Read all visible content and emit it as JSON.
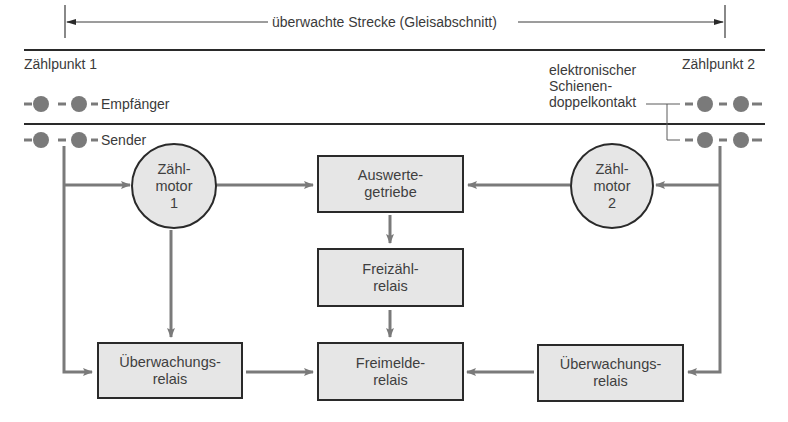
{
  "header": {
    "section_label": "überwachte Strecke (Gleisabschnitt)"
  },
  "counting_points": [
    {
      "label": "Zählpunkt 1"
    },
    {
      "label": "Zählpunkt 2"
    }
  ],
  "sensors": {
    "receiver_label": "Empfänger",
    "sender_label": "Sender",
    "contact_label_lines": [
      "elektronischer",
      "Schienen-",
      "doppelkontakt"
    ]
  },
  "nodes": {
    "counter_motor_1": {
      "lines": [
        "Zähl-",
        "motor",
        "1"
      ]
    },
    "counter_motor_2": {
      "lines": [
        "Zähl-",
        "motor",
        "2"
      ]
    },
    "evaluation_gear": {
      "lines": [
        "Auswerte-",
        "getriebe"
      ]
    },
    "free_count_relay": {
      "lines": [
        "Freizähl-",
        "relais"
      ]
    },
    "monitoring_relay_left": {
      "lines": [
        "Überwachungs-",
        "relais"
      ]
    },
    "clear_signal_relay": {
      "lines": [
        "Freimelde-",
        "relais"
      ]
    },
    "monitoring_relay_right": {
      "lines": [
        "Überwachungs-",
        "relais"
      ]
    }
  },
  "colors": {
    "line_dark": "#2a2a2a",
    "arrow_gray": "#7a7a7a",
    "node_fill": "#e6e6e6",
    "text": "#3a3a3a"
  }
}
